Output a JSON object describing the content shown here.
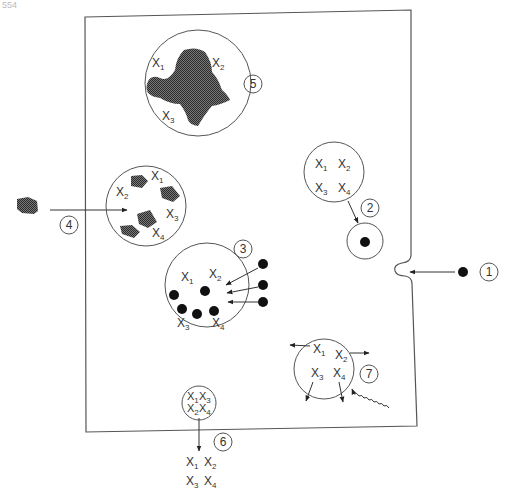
{
  "page_number": "554",
  "colors": {
    "stroke": "#555555",
    "text": "#333333",
    "fill_dark": "#3a3a3a",
    "background": "#ffffff"
  },
  "diagram": {
    "cell_boundary": "cell-membrane",
    "steps": [
      {
        "number": "1",
        "label": "1",
        "description": "particle entering cell via invagination of membrane"
      },
      {
        "number": "2",
        "label": "2",
        "description": "vesicle with X1 X2 X3 X4 pointing to small vesicle with dot"
      },
      {
        "number": "3",
        "label": "3",
        "description": "vesicle with X1-X4 receiving dark particles"
      },
      {
        "number": "4",
        "label": "4",
        "description": "external particle entering vesicle containing X1-X4 and shaded fragments"
      },
      {
        "number": "5",
        "label": "5",
        "description": "vesicle with large shaded mass and X1, X2, X3"
      },
      {
        "number": "6",
        "label": "6",
        "description": "vesicle releasing X1-X4 outside cell"
      },
      {
        "number": "7",
        "label": "7",
        "description": "vesicle with X1-X4 dispersing due to wavy radiation arrow"
      }
    ],
    "labels": {
      "x1": "X",
      "x1_sub": "1",
      "x2": "X",
      "x2_sub": "2",
      "x3": "X",
      "x3_sub": "3",
      "x4": "X",
      "x4_sub": "4"
    }
  }
}
